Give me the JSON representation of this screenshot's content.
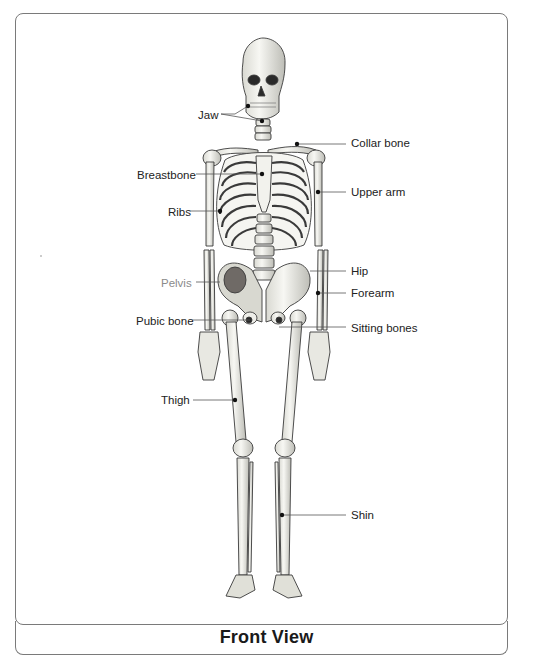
{
  "figure": {
    "title": "Front View",
    "colors": {
      "border": "#7a7a7a",
      "label_text": "#222222",
      "muted_label_text": "#8a8a8a",
      "leader_line": "#555555",
      "bone": "#efefea",
      "bone_outline": "#3a3a3a"
    }
  },
  "labels_left": [
    {
      "id": "jaw",
      "text": "Jaw",
      "x": 198,
      "y": 108,
      "muted": false
    },
    {
      "id": "breastbone",
      "text": "Breastbone",
      "x": 137,
      "y": 168,
      "muted": false
    },
    {
      "id": "ribs",
      "text": "Ribs",
      "x": 168,
      "y": 205,
      "muted": false
    },
    {
      "id": "pelvis",
      "text": "Pelvis",
      "x": 161,
      "y": 276,
      "muted": true
    },
    {
      "id": "pubic-bone",
      "text": "Pubic bone",
      "x": 136,
      "y": 314,
      "muted": false
    },
    {
      "id": "thigh",
      "text": "Thigh",
      "x": 161,
      "y": 393,
      "muted": false
    }
  ],
  "labels_right": [
    {
      "id": "collar-bone",
      "text": "Collar bone",
      "x": 351,
      "y": 136
    },
    {
      "id": "upper-arm",
      "text": "Upper arm",
      "x": 351,
      "y": 185
    },
    {
      "id": "hip",
      "text": "Hip",
      "x": 351,
      "y": 264
    },
    {
      "id": "forearm",
      "text": "Forearm",
      "x": 351,
      "y": 286
    },
    {
      "id": "sitting-bones",
      "text": "Sitting bones",
      "x": 351,
      "y": 321
    },
    {
      "id": "shin",
      "text": "Shin",
      "x": 351,
      "y": 508
    }
  ]
}
